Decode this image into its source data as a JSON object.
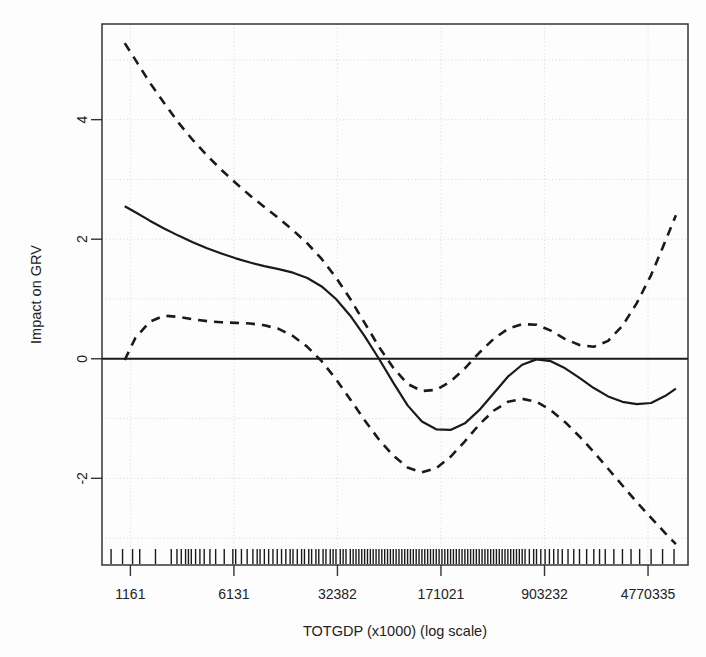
{
  "chart_data": {
    "type": "line",
    "title": "",
    "xlabel": "TOTGDP (x1000) (log scale)",
    "ylabel": "Impact on GRV",
    "x_scale": "log",
    "grid": true,
    "legend": "none",
    "xtick_labels": [
      "1161",
      "6131",
      "32382",
      "171021",
      "903232",
      "4770335"
    ],
    "xtick_values": [
      1161,
      6131,
      32382,
      171021,
      903232,
      4770335
    ],
    "ytick_labels": [
      "-2",
      "0",
      "2",
      "4"
    ],
    "ytick_values": [
      -2,
      0,
      2,
      4
    ],
    "xlim_log10": [
      2.8666,
      6.9576
    ],
    "ylim": [
      -3.45,
      5.6
    ],
    "zero_line": 0,
    "series": [
      {
        "name": "smooth-estimate",
        "style": "solid",
        "color": "#1a1a1a",
        "x_log10": [
          3.0253,
          3.1,
          3.2,
          3.3,
          3.4,
          3.5,
          3.6,
          3.7,
          3.8,
          3.9,
          4.0,
          4.1,
          4.2,
          4.3,
          4.4,
          4.5,
          4.6,
          4.7,
          4.8,
          4.9,
          5.0,
          5.1,
          5.2,
          5.3,
          5.4,
          5.5,
          5.6,
          5.7,
          5.8,
          5.9,
          6.0,
          6.1,
          6.2,
          6.3,
          6.4,
          6.5,
          6.6,
          6.7,
          6.8,
          6.8731
        ],
        "y": [
          2.55,
          2.45,
          2.31,
          2.18,
          2.06,
          1.95,
          1.85,
          1.76,
          1.68,
          1.61,
          1.55,
          1.5,
          1.44,
          1.35,
          1.21,
          1.0,
          0.72,
          0.38,
          0.0,
          -0.4,
          -0.78,
          -1.05,
          -1.18,
          -1.19,
          -1.08,
          -0.86,
          -0.58,
          -0.3,
          -0.1,
          -0.01,
          -0.04,
          -0.16,
          -0.32,
          -0.49,
          -0.63,
          -0.72,
          -0.76,
          -0.74,
          -0.62,
          -0.5
        ],
        "endpoint_values": {
          "left": 2.55,
          "right": -0.3,
          "min": -1.19,
          "local_max_right": 0.0
        }
      },
      {
        "name": "upper-confidence-band",
        "style": "dashed",
        "color": "#1a1a1a",
        "x_log10": [
          3.0253,
          3.1,
          3.2,
          3.3,
          3.4,
          3.5,
          3.6,
          3.7,
          3.8,
          3.9,
          4.0,
          4.1,
          4.2,
          4.3,
          4.4,
          4.5,
          4.6,
          4.7,
          4.8,
          4.9,
          5.0,
          5.1,
          5.2,
          5.3,
          5.4,
          5.5,
          5.6,
          5.7,
          5.8,
          5.9,
          6.0,
          6.1,
          6.2,
          6.3,
          6.4,
          6.5,
          6.6,
          6.7,
          6.8,
          6.8731
        ],
        "y": [
          5.28,
          5.0,
          4.62,
          4.28,
          3.95,
          3.66,
          3.4,
          3.16,
          2.94,
          2.73,
          2.54,
          2.35,
          2.15,
          1.93,
          1.67,
          1.36,
          1.0,
          0.6,
          0.2,
          -0.15,
          -0.42,
          -0.54,
          -0.52,
          -0.38,
          -0.16,
          0.1,
          0.33,
          0.5,
          0.58,
          0.57,
          0.47,
          0.33,
          0.23,
          0.2,
          0.3,
          0.55,
          0.93,
          1.4,
          1.97,
          2.4
        ],
        "endpoint_values": {
          "left": 5.28,
          "right": 2.4
        }
      },
      {
        "name": "lower-confidence-band",
        "style": "dashed",
        "color": "#1a1a1a",
        "x_log10": [
          3.0253,
          3.1,
          3.2,
          3.3,
          3.4,
          3.5,
          3.6,
          3.7,
          3.8,
          3.9,
          4.0,
          4.1,
          4.2,
          4.3,
          4.4,
          4.5,
          4.6,
          4.7,
          4.8,
          4.9,
          5.0,
          5.1,
          5.2,
          5.3,
          5.4,
          5.5,
          5.6,
          5.7,
          5.8,
          5.9,
          6.0,
          6.1,
          6.2,
          6.3,
          6.4,
          6.5,
          6.6,
          6.7,
          6.8,
          6.8731
        ],
        "y": [
          -0.02,
          0.35,
          0.62,
          0.72,
          0.7,
          0.66,
          0.63,
          0.61,
          0.6,
          0.59,
          0.56,
          0.5,
          0.38,
          0.2,
          -0.04,
          -0.34,
          -0.68,
          -1.03,
          -1.35,
          -1.62,
          -1.82,
          -1.9,
          -1.83,
          -1.64,
          -1.38,
          -1.1,
          -0.87,
          -0.72,
          -0.67,
          -0.72,
          -0.86,
          -1.06,
          -1.3,
          -1.56,
          -1.84,
          -2.12,
          -2.4,
          -2.66,
          -2.92,
          -3.1
        ],
        "endpoint_values": {
          "left": 0.0,
          "right": -3.1,
          "peak_left": 0.72,
          "min": -1.9
        }
      }
    ],
    "rug": {
      "name": "data-rug-marks",
      "description": "vertical tick marks at observed TOTGDP values along bottom axis",
      "x_log10": [
        2.93,
        3.01,
        3.08,
        3.13,
        3.24,
        3.35,
        3.39,
        3.42,
        3.45,
        3.47,
        3.49,
        3.52,
        3.55,
        3.58,
        3.62,
        3.66,
        3.72,
        3.78,
        3.8,
        3.84,
        3.88,
        3.92,
        3.95,
        3.97,
        4.0,
        4.03,
        4.06,
        4.09,
        4.12,
        4.15,
        4.18,
        4.2,
        4.23,
        4.26,
        4.28,
        4.31,
        4.33,
        4.36,
        4.38,
        4.41,
        4.43,
        4.46,
        4.48,
        4.5,
        4.53,
        4.55,
        4.57,
        4.6,
        4.62,
        4.64,
        4.66,
        4.68,
        4.7,
        4.72,
        4.74,
        4.76,
        4.78,
        4.8,
        4.82,
        4.84,
        4.86,
        4.88,
        4.9,
        4.92,
        4.94,
        4.96,
        4.98,
        5.0,
        5.02,
        5.04,
        5.06,
        5.08,
        5.1,
        5.12,
        5.14,
        5.16,
        5.18,
        5.2,
        5.22,
        5.24,
        5.26,
        5.28,
        5.3,
        5.32,
        5.34,
        5.36,
        5.38,
        5.4,
        5.42,
        5.44,
        5.46,
        5.48,
        5.5,
        5.52,
        5.54,
        5.56,
        5.58,
        5.6,
        5.62,
        5.64,
        5.66,
        5.68,
        5.7,
        5.72,
        5.74,
        5.76,
        5.78,
        5.8,
        5.82,
        5.85,
        5.88,
        5.9,
        5.93,
        5.96,
        5.99,
        6.02,
        6.05,
        6.08,
        6.12,
        6.16,
        6.2,
        6.25,
        6.3,
        6.34,
        6.38,
        6.44,
        6.5,
        6.56,
        6.62,
        6.7,
        6.78,
        6.86
      ]
    }
  },
  "figure": {
    "background": "#ffffff",
    "axis_color": "#333333",
    "grid_color": "#cfcfcf",
    "curve_color": "#1a1a1a"
  }
}
